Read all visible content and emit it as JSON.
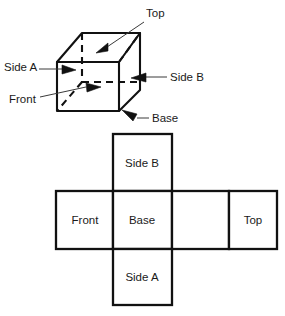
{
  "figure": {
    "title": "",
    "background_color": "#ffffff",
    "line_color": "#111111",
    "text_color": "#1a1a1a"
  },
  "cube_diagram": {
    "name": "cube-perspective-diagram",
    "labels": [
      {
        "id": "top",
        "text": "Top",
        "x": 146,
        "y": 17,
        "anchor": "start"
      },
      {
        "id": "side-a",
        "text": "Side A",
        "x": 4,
        "y": 71,
        "anchor": "start"
      },
      {
        "id": "side-b",
        "text": "Side B",
        "x": 170,
        "y": 81,
        "anchor": "start"
      },
      {
        "id": "front",
        "text": "Front",
        "x": 9,
        "y": 103,
        "anchor": "start"
      },
      {
        "id": "base",
        "text": "Base",
        "x": 152,
        "y": 122,
        "anchor": "start"
      }
    ]
  },
  "net_diagram": {
    "name": "cube-net-diagram",
    "cells": [
      {
        "id": "side-b",
        "text": "Side B",
        "x": 113,
        "y": 134,
        "w": 59,
        "h": 57,
        "label_x": 142,
        "label_y": 167
      },
      {
        "id": "front",
        "text": "Front",
        "x": 56,
        "y": 191,
        "w": 57,
        "h": 58,
        "label_x": 85,
        "label_y": 224
      },
      {
        "id": "base",
        "text": "Base",
        "x": 113,
        "y": 191,
        "w": 59,
        "h": 58,
        "label_x": 142,
        "label_y": 224
      },
      {
        "id": "blank",
        "text": "",
        "x": 172,
        "y": 191,
        "w": 57,
        "h": 58,
        "label_x": 200,
        "label_y": 224
      },
      {
        "id": "top",
        "text": "Top",
        "x": 229,
        "y": 191,
        "w": 48,
        "h": 58,
        "label_x": 253,
        "label_y": 224
      },
      {
        "id": "side-a",
        "text": "Side A",
        "x": 113,
        "y": 249,
        "w": 59,
        "h": 56,
        "label_x": 142,
        "label_y": 281
      }
    ]
  }
}
